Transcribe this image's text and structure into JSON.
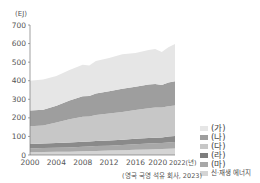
{
  "chart_data": {
    "type": "area",
    "stacked": true,
    "title": "",
    "xlabel": "",
    "ylabel": "(EJ)",
    "ylim": [
      0,
      700
    ],
    "yticks": [
      0,
      100,
      200,
      300,
      400,
      500,
      600,
      700
    ],
    "xticks": [
      "2000",
      "2004",
      "2008",
      "2012",
      "2016",
      "2020",
      "2022(년)"
    ],
    "x": [
      2000,
      2002,
      2004,
      2006,
      2008,
      2009,
      2010,
      2012,
      2014,
      2016,
      2018,
      2019,
      2020,
      2021,
      2022
    ],
    "series": [
      {
        "name": "신·재생 에너지",
        "color": "#d4d4d4",
        "values": [
          15,
          16,
          17,
          18,
          20,
          21,
          22,
          24,
          26,
          28,
          30,
          31,
          32,
          34,
          35
        ]
      },
      {
        "name": "(마)",
        "color": "#a8a8a8",
        "values": [
          20,
          21,
          22,
          23,
          24,
          24,
          26,
          26,
          28,
          30,
          32,
          32,
          33,
          34,
          35
        ]
      },
      {
        "name": "(라)",
        "color": "#8a8a8a",
        "values": [
          25,
          25,
          26,
          27,
          27,
          27,
          28,
          28,
          28,
          29,
          30,
          30,
          30,
          31,
          32
        ]
      },
      {
        "name": "(다)",
        "color": "#c7c7c7",
        "values": [
          95,
          97,
          110,
          125,
          135,
          135,
          140,
          145,
          150,
          155,
          160,
          162,
          160,
          163,
          165
        ]
      },
      {
        "name": "(나)",
        "color": "#9e9e9e",
        "values": [
          85,
          85,
          90,
          100,
          110,
          110,
          115,
          120,
          125,
          125,
          128,
          128,
          122,
          128,
          130
        ]
      },
      {
        "name": "(가)",
        "color": "#e6e6e6",
        "values": [
          160,
          162,
          160,
          165,
          170,
          165,
          175,
          180,
          185,
          183,
          185,
          187,
          178,
          190,
          200
        ]
      }
    ],
    "totals": [
      400,
      406,
      425,
      458,
      486,
      482,
      506,
      523,
      542,
      550,
      565,
      570,
      555,
      580,
      597
    ],
    "legend_position": "right-bottom",
    "grid": false,
    "source": "(영국 국영 석유 회사, 2023)"
  },
  "axis": {
    "unit": "(EJ)",
    "y_labels": [
      "0",
      "100",
      "200",
      "300",
      "400",
      "500",
      "600",
      "700"
    ],
    "x_labels": [
      "2000",
      "2004",
      "2008",
      "2012",
      "2016",
      "2020",
      "2022(년)"
    ]
  },
  "legend": {
    "items": [
      {
        "label": "(가)",
        "color": "#e6e6e6"
      },
      {
        "label": "(나)",
        "color": "#9e9e9e"
      },
      {
        "label": "(다)",
        "color": "#c7c7c7"
      },
      {
        "label": "(라)",
        "color": "#7e7e7e"
      },
      {
        "label": "(마)",
        "color": "#a8a8a8"
      },
      {
        "label": "신·재생 에너지",
        "color": "#d4d4d4"
      }
    ]
  },
  "source": "(영국 국영 석유 회사, 2023)"
}
